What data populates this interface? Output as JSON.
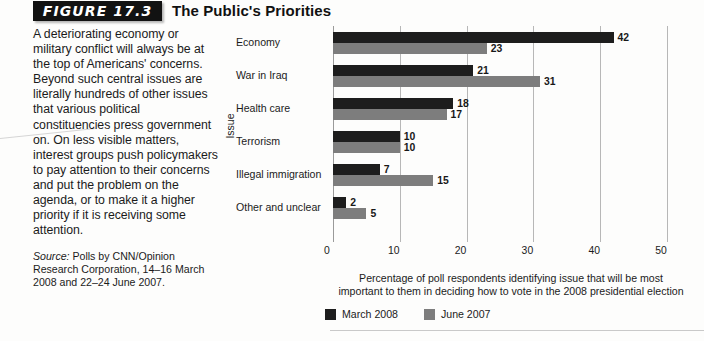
{
  "figure": {
    "number_label": "FIGURE 17.3",
    "title": "The Public's Priorities",
    "caption": "A deteriorating economy or military conflict will always be at the top of Americans' concerns. Beyond such central issues are literally hundreds of other issues that various political constituencies press government on. On less visible matters, interest groups push policymakers to pay attention to their concerns and put the problem on the agenda, or to make it a higher priority if it is receiving some attention.",
    "source_label": "Source:",
    "source_text": " Polls by CNN/Opinion Research Corporation, 14–16 March 2008 and 22–24 June 2007."
  },
  "chart_data": {
    "type": "bar",
    "orientation": "horizontal",
    "title": "The Public's Priorities",
    "categories": [
      "Economy",
      "War in Iraq",
      "Health care",
      "Terrorism",
      "Illegal immigration",
      "Other and unclear"
    ],
    "series": [
      {
        "name": "March 2008",
        "color": "#1d1d1d",
        "values": [
          42,
          21,
          18,
          10,
          7,
          2
        ]
      },
      {
        "name": "June 2007",
        "color": "#7d7d7d",
        "values": [
          23,
          31,
          17,
          10,
          15,
          5
        ]
      }
    ],
    "xlabel": "Percentage of poll respondents identifying issue that will be most important to them in deciding how to vote in the 2008 presidential election",
    "xlabel_line1": "Percentage of poll respondents identifying issue that will be most",
    "xlabel_line2": "important to them in deciding how to vote in the 2008 presidential election",
    "ylabel": "Issue",
    "xlim": [
      0,
      50
    ],
    "xticks": [
      0,
      10,
      20,
      30,
      40,
      50
    ],
    "xtick_labels": [
      "0",
      "10",
      "20",
      "30",
      "40",
      "50"
    ],
    "grid": true,
    "grid_axis": "x",
    "legend_position": "bottom-left",
    "data_labels": true
  }
}
